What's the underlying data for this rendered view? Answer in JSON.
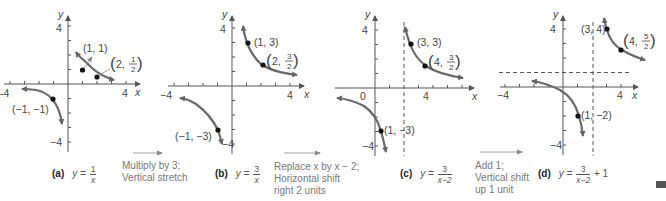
{
  "figure": {
    "panels": [
      {
        "id": "a",
        "tag": "(a)",
        "equation": {
          "lhs": "y =",
          "num": "1",
          "den": "x",
          "suffix": ""
        },
        "axis": {
          "x_label": "x",
          "y_label": "y",
          "tick_labels": {
            "x_neg": "−4",
            "x_pos": "4",
            "y_pos": "4",
            "y_neg": "−4"
          }
        },
        "points": [
          {
            "label": "(1, 1)"
          },
          {
            "label_prefix": "2,",
            "num": "1",
            "den": "2"
          },
          {
            "label": "(−1, −1)"
          }
        ]
      },
      {
        "id": "b",
        "tag": "(b)",
        "equation": {
          "lhs": "y =",
          "num": "3",
          "den": "x",
          "suffix": ""
        },
        "axis": {
          "x_label": "x",
          "y_label": "y",
          "tick_labels": {
            "x_neg": "−4",
            "x_pos": "4",
            "y_pos": "4",
            "y_neg": "−4"
          }
        },
        "points": [
          {
            "label": "(1, 3)"
          },
          {
            "label_prefix": "2,",
            "num": "3",
            "den": "2"
          },
          {
            "label": "(−1, −3)"
          }
        ]
      },
      {
        "id": "c",
        "tag": "(c)",
        "equation": {
          "lhs": "y =",
          "num": "3",
          "den": "x−2",
          "suffix": ""
        },
        "axis": {
          "x_label": "x",
          "y_label": "y",
          "tick_labels": {
            "origin": "0",
            "x_pos": "4",
            "y_pos": "4",
            "y_neg": "−4"
          }
        },
        "points": [
          {
            "label": "(3, 3)"
          },
          {
            "label_prefix": "4,",
            "num": "3",
            "den": "2"
          },
          {
            "label": "(1, −3)"
          }
        ]
      },
      {
        "id": "d",
        "tag": "(d)",
        "equation": {
          "lhs": "y =",
          "num": "3",
          "den": "x−2",
          "suffix": "+ 1"
        },
        "axis": {
          "x_label": "x",
          "y_label": "y",
          "tick_labels": {
            "x_neg": "−4",
            "x_pos": "4",
            "y_pos": "4",
            "y_neg": "−4"
          }
        },
        "points": [
          {
            "label": "(3, 4)"
          },
          {
            "label_prefix": "4,",
            "num": "5",
            "den": "2"
          },
          {
            "label": "(1, −2)"
          }
        ]
      }
    ],
    "steps": [
      {
        "line1": "Multiply by 3;",
        "line2": "Vertical stretch",
        "line3": ""
      },
      {
        "line1": "Replace x by x − 2;",
        "line2": "Horizontal shift",
        "line3": "right 2 units"
      },
      {
        "line1": "Add 1;",
        "line2": "Vertical shift",
        "line3": "up 1 unit"
      }
    ],
    "colors": {
      "curve": "#6a6a6a",
      "axis": "#555555",
      "point": "#111111",
      "text": "#444444"
    }
  }
}
